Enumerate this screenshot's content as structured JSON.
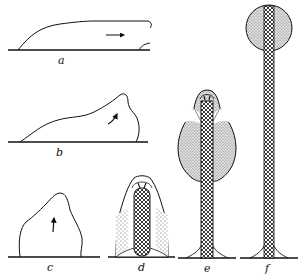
{
  "figure": {
    "panels": [
      {
        "id": "a",
        "label": "a",
        "description": "flattened slug migrating on substrate",
        "arrow": "right"
      },
      {
        "id": "b",
        "label": "b",
        "description": "slug raising anterior end",
        "arrow": "curved up"
      },
      {
        "id": "c",
        "label": "c",
        "description": "upright mound",
        "arrow": "up"
      },
      {
        "id": "d",
        "label": "d",
        "description": "stalk forming inside cell mass"
      },
      {
        "id": "e",
        "label": "e",
        "description": "cell mass rising on elongating stalk"
      },
      {
        "id": "f",
        "label": "f",
        "description": "mature fruiting body with spherical sorus atop long stalk"
      }
    ],
    "colors": {
      "line": "#1a1a1a",
      "stipple": "#b8b8b8",
      "background": "#ffffff"
    }
  }
}
